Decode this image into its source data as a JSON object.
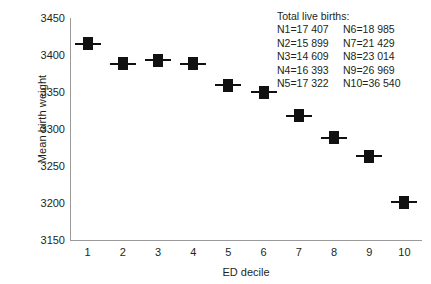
{
  "chart_data": {
    "type": "scatter",
    "title": "",
    "xlabel": "ED decile",
    "ylabel": "Mean birth weight",
    "categories": [
      "1",
      "2",
      "3",
      "4",
      "5",
      "6",
      "7",
      "8",
      "9",
      "10"
    ],
    "values": [
      3415,
      3388,
      3393,
      3388,
      3359,
      3350,
      3318,
      3288,
      3263,
      3201
    ],
    "series": [
      {
        "name": "Mean birth weight",
        "values": [
          3415,
          3388,
          3393,
          3388,
          3359,
          3350,
          3318,
          3288,
          3263,
          3201
        ]
      }
    ],
    "ylim": [
      3150,
      3450
    ],
    "yticks": [
      "3450",
      "3400",
      "3350",
      "3300",
      "3250",
      "3200",
      "3150"
    ],
    "ytick_values": [
      3450,
      3400,
      3350,
      3300,
      3250,
      3200,
      3150
    ],
    "grid": false,
    "legend": null,
    "marker": "filled-square-with-horizontal-error-bar",
    "marker_color": "#111111",
    "axis_color": "#9a9a9a",
    "background": "#ffffff"
  },
  "annotation": {
    "heading": "Total live births:",
    "rows": [
      {
        "left": "N1=17 407",
        "right": "N6=18 985"
      },
      {
        "left": "N2=15 899",
        "right": "N7=21 429"
      },
      {
        "left": "N3=14 609",
        "right": "N8=23 014"
      },
      {
        "left": "N4=16 393",
        "right": "N9=26 969"
      },
      {
        "left": "N5=17 322",
        "right": "N10=36 540"
      }
    ]
  }
}
